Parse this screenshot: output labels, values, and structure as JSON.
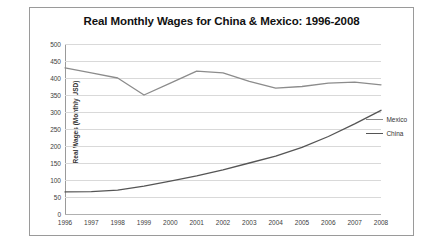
{
  "chart_data": {
    "type": "line",
    "title": "Real Monthly Wages for China & Mexico: 1996-2008",
    "xlabel": "",
    "ylabel": "Real Wages (Monthly USD)",
    "x": [
      1996,
      1997,
      1998,
      1999,
      2000,
      2001,
      2002,
      2003,
      2004,
      2005,
      2006,
      2007,
      2008
    ],
    "xticklabels": [
      "1996",
      "1997",
      "1998",
      "1999",
      "2000",
      "2001",
      "2002",
      "2003",
      "2004",
      "2005",
      "2006",
      "2007",
      "2008"
    ],
    "ylim": [
      0,
      500
    ],
    "yticks": [
      0,
      50,
      100,
      150,
      200,
      250,
      300,
      350,
      400,
      450,
      500
    ],
    "yticklabels": [
      "0",
      "50",
      "100",
      "150",
      "200",
      "250",
      "300",
      "350",
      "400",
      "450",
      "500"
    ],
    "grid": true,
    "legend_position": "right",
    "series": [
      {
        "name": "Mexico",
        "color": "#8c8c8c",
        "values": [
          430,
          415,
          400,
          350,
          385,
          420,
          415,
          390,
          370,
          375,
          385,
          388,
          380
        ]
      },
      {
        "name": "China",
        "color": "#555555",
        "values": [
          65,
          66,
          70,
          82,
          97,
          112,
          130,
          150,
          170,
          196,
          228,
          265,
          305
        ]
      }
    ]
  },
  "legend": {
    "items": [
      {
        "label": "Mexico"
      },
      {
        "label": "China"
      }
    ]
  }
}
